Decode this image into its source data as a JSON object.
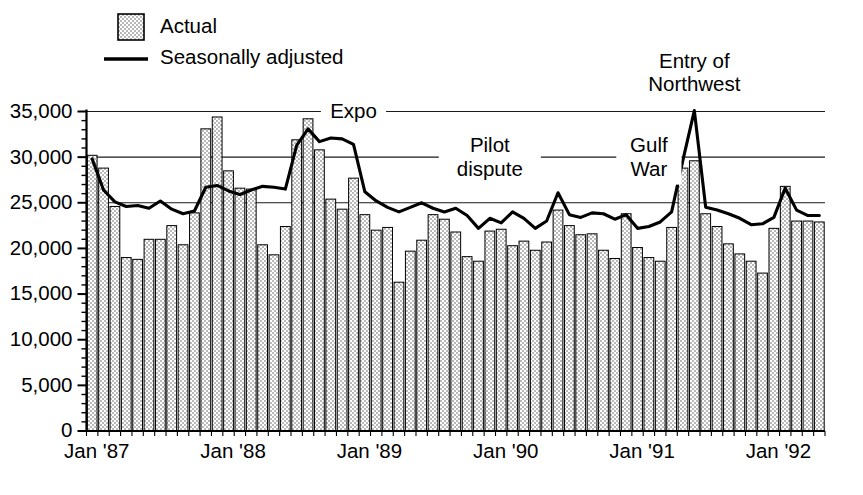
{
  "chart_data": {
    "type": "bar",
    "title": "",
    "subtitle": "",
    "xlabel": "",
    "ylabel": "",
    "ylim": [
      0,
      35000
    ],
    "y_ticks": [
      0,
      5000,
      10000,
      15000,
      20000,
      25000,
      30000,
      35000
    ],
    "y_tick_labels": [
      "0",
      "5,000",
      "10,000",
      "15,000",
      "20,000",
      "25,000",
      "30,000",
      "35,000"
    ],
    "y_minor_tick_step": 1000,
    "grid": true,
    "grid_axis": "y",
    "grid_values": [
      25000,
      30000,
      35000
    ],
    "legend_position": "top-left",
    "legend": [
      {
        "label": "Actual",
        "marker": "dotted-bar-swatch"
      },
      {
        "label": "Seasonally adjusted",
        "marker": "solid-line"
      }
    ],
    "x_tick_labels": [
      "Jan '87",
      "Jan '88",
      "Jan '89",
      "Jan '90",
      "Jan '91",
      "Jan '92"
    ],
    "x_tick_months": [
      "1987-01",
      "1988-01",
      "1989-01",
      "1990-01",
      "1991-01",
      "1992-01"
    ],
    "categories": [
      "Jan '87",
      "Feb '87",
      "Mar '87",
      "Apr '87",
      "May '87",
      "Jun '87",
      "Jul '87",
      "Aug '87",
      "Sep '87",
      "Oct '87",
      "Nov '87",
      "Dec '87",
      "Jan '88",
      "Feb '88",
      "Mar '88",
      "Apr '88",
      "May '88",
      "Jun '88",
      "Jul '88",
      "Aug '88",
      "Sep '88",
      "Oct '88",
      "Nov '88",
      "Dec '88",
      "Jan '89",
      "Feb '89",
      "Mar '89",
      "Apr '89",
      "May '89",
      "Jun '89",
      "Jul '89",
      "Aug '89",
      "Sep '89",
      "Oct '89",
      "Nov '89",
      "Dec '89",
      "Jan '90",
      "Feb '90",
      "Mar '90",
      "Apr '90",
      "May '90",
      "Jun '90",
      "Jul '90",
      "Aug '90",
      "Sep '90",
      "Oct '90",
      "Nov '90",
      "Dec '90",
      "Jan '91",
      "Feb '91",
      "Mar '91",
      "Apr '91",
      "May '91",
      "Jun '91",
      "Jul '91",
      "Aug '91",
      "Sep '91",
      "Oct '91",
      "Nov '91",
      "Dec '91",
      "Jan '92",
      "Feb '92",
      "Mar '92",
      "Apr '92",
      "May '92"
    ],
    "series": [
      {
        "name": "Actual",
        "type": "bar",
        "values": [
          30200,
          28800,
          24600,
          19000,
          18800,
          21000,
          21000,
          22500,
          20400,
          23900,
          33100,
          34400,
          28500,
          26600,
          26500,
          20400,
          19300,
          22400,
          31900,
          34200,
          30800,
          25400,
          24300,
          27700,
          23700,
          22000,
          22300,
          16300,
          19700,
          20900,
          23700,
          23200,
          21800,
          19100,
          18600,
          21900,
          22100,
          20300,
          20800,
          19800,
          20700,
          24200,
          22500,
          21500,
          21600,
          19800,
          18900,
          23800,
          20100,
          19000,
          18600,
          22300,
          28800,
          29600,
          23800,
          22400,
          20500,
          19400,
          18600,
          17300,
          22200,
          26800,
          23000,
          23000,
          22900
        ]
      },
      {
        "name": "Seasonally adjusted",
        "type": "line",
        "values": [
          29800,
          26400,
          25100,
          24600,
          24700,
          24400,
          25200,
          24300,
          23800,
          24100,
          26700,
          26900,
          26300,
          25900,
          26400,
          26800,
          26700,
          26500,
          31300,
          33100,
          31700,
          32100,
          32000,
          31400,
          26200,
          25200,
          24500,
          24000,
          24500,
          25000,
          24400,
          24000,
          24400,
          23600,
          22200,
          23300,
          22800,
          24000,
          23300,
          22200,
          23000,
          26100,
          23700,
          23400,
          23900,
          23800,
          23200,
          23700,
          22200,
          22400,
          22900,
          24000,
          29700,
          35100,
          24500,
          24200,
          23800,
          23300,
          22600,
          22700,
          23400,
          26600,
          24200,
          23600,
          23600
        ]
      }
    ],
    "annotations": [
      {
        "text": "Expo",
        "at_month": "1988-12",
        "at_value": 35000,
        "rule": "horizontal-both"
      },
      {
        "text": "Pilot dispute",
        "at_month": "1989-12",
        "at_value": 30000,
        "rule": "horizontal-both",
        "lines": [
          "Pilot",
          "dispute"
        ]
      },
      {
        "text": "Gulf War",
        "at_month": "1991-02",
        "at_value": 30000,
        "rule": "horizontal-both",
        "lines": [
          "Gulf",
          "War"
        ]
      },
      {
        "text": "Entry of Northwest",
        "at_month": "1991-06",
        "at_value": 35100,
        "rule": "none",
        "lines": [
          "Entry of",
          "Northwest"
        ]
      }
    ]
  },
  "colors": {
    "ink": "#000000",
    "grid": "#1a1a1a",
    "background": "#ffffff",
    "bar_fill": "#e8e8e8"
  }
}
